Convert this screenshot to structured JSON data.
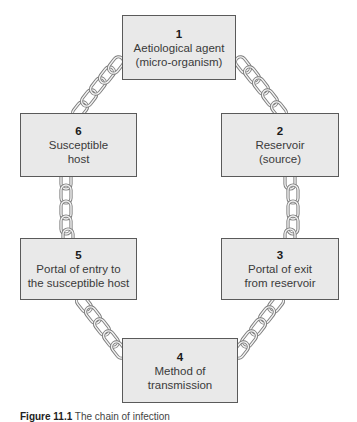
{
  "diagram": {
    "title": "The chain of infection",
    "style": {
      "box_fill": "#e9e9e9",
      "box_border": "#5a5a5a",
      "chain_color": "#8a8a8a",
      "chain_highlight": "#f4f4f4"
    },
    "nodes": [
      {
        "id": 1,
        "number": "1",
        "lines": [
          "Aetiological agent",
          "(micro-organism)"
        ]
      },
      {
        "id": 2,
        "number": "2",
        "lines": [
          "Reservoir",
          "(source)"
        ]
      },
      {
        "id": 3,
        "number": "3",
        "lines": [
          "Portal of exit",
          "from reservoir"
        ]
      },
      {
        "id": 4,
        "number": "4",
        "lines": [
          "Method of",
          "transmission"
        ]
      },
      {
        "id": 5,
        "number": "5",
        "lines": [
          "Portal of entry to",
          "the susceptible host"
        ]
      },
      {
        "id": 6,
        "number": "6",
        "lines": [
          "Susceptible",
          "host"
        ]
      }
    ],
    "edges": [
      {
        "from": 1,
        "to": 2,
        "type": "chain"
      },
      {
        "from": 2,
        "to": 3,
        "type": "chain"
      },
      {
        "from": 3,
        "to": 4,
        "type": "chain"
      },
      {
        "from": 4,
        "to": 5,
        "type": "chain"
      },
      {
        "from": 5,
        "to": 6,
        "type": "chain"
      },
      {
        "from": 6,
        "to": 1,
        "type": "chain"
      }
    ]
  },
  "caption": {
    "label": "Figure 11.1",
    "text": "The chain of infection"
  }
}
